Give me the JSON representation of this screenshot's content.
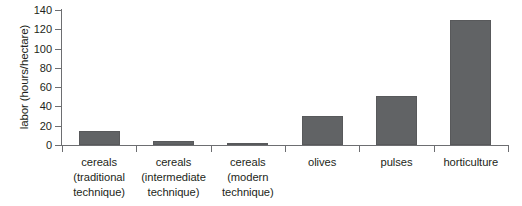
{
  "chart_data": {
    "type": "bar",
    "title": "",
    "subtitle": "",
    "xlabel": "",
    "ylabel": "labor (hours/hectare)",
    "categories": [
      "cereals (traditional technique)",
      "cereals (intermediate technique)",
      "cereals (modern technique)",
      "olives",
      "pulses",
      "horticulture"
    ],
    "category_lines": [
      [
        "cereals",
        "(traditional",
        "technique)"
      ],
      [
        "cereals",
        "(intermediate",
        "technique)"
      ],
      [
        "cereals",
        "(modern",
        "technique)"
      ],
      [
        "olives"
      ],
      [
        "pulses"
      ],
      [
        "horticulture"
      ]
    ],
    "values": [
      15,
      4,
      2,
      30,
      51,
      130
    ],
    "ylim": [
      0,
      140
    ],
    "yticks": [
      0,
      20,
      40,
      60,
      80,
      100,
      120,
      140
    ],
    "ytick_labels": [
      "0",
      "20",
      "40",
      "60",
      "80",
      "100",
      "120",
      "140"
    ],
    "grid": false,
    "legend": false,
    "bar_color": "#616365",
    "bar_border_color": "#58595b",
    "axis_color": "#6d6e71",
    "text_color": "#231f20",
    "background": "#ffffff"
  }
}
